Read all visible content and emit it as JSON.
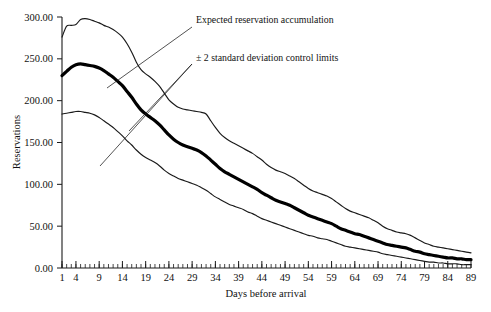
{
  "chart_data": {
    "type": "line",
    "title": "",
    "xlabel": "Days before arrival",
    "ylabel": "Reservations",
    "xlim": [
      1,
      89
    ],
    "ylim": [
      0,
      300
    ],
    "grid": false,
    "legend_position": "inline-annotations",
    "ytick_labels": [
      "0.00",
      "50.00",
      "100.00",
      "150.00",
      "200.00",
      "250.00",
      "300.00"
    ],
    "ytick_values": [
      0,
      50,
      100,
      150,
      200,
      250,
      300
    ],
    "xtick_labels": [
      "1",
      "4",
      "9",
      "14",
      "19",
      "24",
      "29",
      "34",
      "39",
      "44",
      "49",
      "54",
      "59",
      "64",
      "69",
      "74",
      "79",
      "84",
      "89"
    ],
    "xtick_values": [
      1,
      4,
      9,
      14,
      19,
      24,
      29,
      34,
      39,
      44,
      49,
      54,
      59,
      64,
      69,
      74,
      79,
      84,
      89
    ],
    "x": [
      1,
      2,
      3,
      4,
      5,
      6,
      7,
      8,
      9,
      10,
      11,
      12,
      13,
      14,
      15,
      16,
      17,
      18,
      19,
      20,
      21,
      22,
      23,
      24,
      25,
      26,
      27,
      28,
      29,
      30,
      31,
      32,
      33,
      34,
      35,
      36,
      37,
      38,
      39,
      40,
      41,
      42,
      43,
      44,
      45,
      46,
      47,
      48,
      49,
      50,
      51,
      52,
      53,
      54,
      55,
      56,
      57,
      58,
      59,
      60,
      61,
      62,
      63,
      64,
      65,
      66,
      67,
      68,
      69,
      70,
      71,
      72,
      73,
      74,
      75,
      76,
      77,
      78,
      79,
      80,
      81,
      82,
      83,
      84,
      85,
      86,
      87,
      88,
      89
    ],
    "series": [
      {
        "name": "Upper control limit (+2 SD)",
        "style": "thin",
        "values": [
          276,
          289,
          290,
          291,
          297,
          298,
          297,
          295,
          293,
          290,
          288,
          285,
          281,
          276,
          268,
          258,
          246,
          237,
          232,
          228,
          223,
          217,
          209,
          201,
          196,
          192,
          190,
          189,
          188,
          187,
          186,
          184,
          176,
          168,
          161,
          156,
          152,
          149,
          146,
          143,
          140,
          137,
          133,
          129,
          124,
          120,
          117,
          115,
          113,
          110,
          107,
          103,
          99,
          95,
          92,
          90,
          88,
          86,
          83,
          79,
          75,
          71,
          68,
          66,
          64,
          62,
          60,
          57,
          54,
          50,
          47,
          45,
          43,
          42,
          41,
          39,
          36,
          33,
          30,
          28,
          26,
          25,
          24,
          23,
          22,
          21,
          20,
          19,
          18
        ]
      },
      {
        "name": "Expected reservation accumulation",
        "style": "thick",
        "values": [
          230,
          235,
          240,
          243,
          244,
          243,
          242,
          241,
          239,
          236,
          232,
          228,
          223,
          218,
          211,
          204,
          196,
          189,
          184,
          180,
          176,
          171,
          165,
          159,
          154,
          150,
          147,
          145,
          143,
          141,
          138,
          134,
          129,
          124,
          119,
          115,
          112,
          109,
          106,
          103,
          100,
          97,
          94,
          90,
          87,
          84,
          81,
          79,
          77,
          75,
          72,
          69,
          66,
          63,
          61,
          59,
          57,
          55,
          53,
          50,
          47,
          45,
          43,
          41,
          40,
          38,
          36,
          34,
          32,
          30,
          28,
          27,
          26,
          25,
          24,
          22,
          20,
          19,
          17,
          16,
          15,
          14,
          13,
          12,
          12,
          11,
          11,
          10,
          10
        ]
      },
      {
        "name": "Lower control limit (−2 SD)",
        "style": "thin",
        "values": [
          184,
          185,
          186,
          187,
          187,
          186,
          185,
          183,
          180,
          176,
          172,
          168,
          163,
          158,
          152,
          147,
          141,
          136,
          132,
          129,
          126,
          122,
          117,
          113,
          110,
          107,
          105,
          103,
          101,
          99,
          96,
          93,
          89,
          85,
          82,
          79,
          76,
          74,
          72,
          70,
          67,
          65,
          62,
          59,
          57,
          55,
          53,
          51,
          49,
          47,
          45,
          43,
          41,
          39,
          38,
          36,
          35,
          34,
          32,
          30,
          28,
          26,
          25,
          24,
          23,
          22,
          21,
          20,
          19,
          17,
          16,
          15,
          14,
          13,
          12,
          11,
          10,
          9,
          8,
          7,
          7,
          6,
          6,
          5,
          5,
          5,
          4,
          4,
          4
        ]
      }
    ],
    "annotations": [
      {
        "id": "expected-annotation",
        "text": "Expected reservation accumulation",
        "text_x": 196,
        "text_y": 23,
        "leader_from_x": 192,
        "leader_from_y": 27,
        "leader_to_x": 107,
        "leader_to_y": 88
      },
      {
        "id": "control-limits-annotation",
        "text": "± 2 standard deviation control limits",
        "text_x": 196,
        "text_y": 61,
        "leader_from_x": 192,
        "leader_from_y": 64,
        "leader_a_to_x": 129,
        "leader_a_to_y": 131,
        "leader_b_to_x": 100,
        "leader_b_to_y": 166
      }
    ]
  }
}
